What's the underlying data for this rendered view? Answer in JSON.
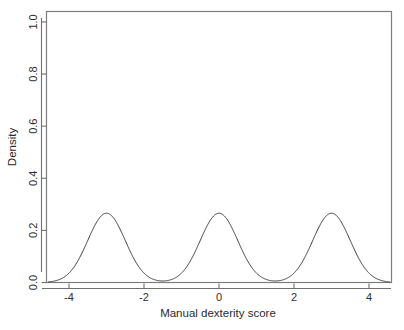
{
  "figure": {
    "background_color": "#ffffff",
    "curve_color": "#3a3a3a",
    "axis_color": "#6f6f6f",
    "box_color": "#7d7d7d"
  },
  "chart_data": {
    "type": "line",
    "title": "",
    "subtitle": "",
    "xlabel": "Manual dexterity score",
    "ylabel": "Density",
    "xlim": [
      -4.6,
      4.6
    ],
    "ylim": [
      0.0,
      1.04
    ],
    "grid": false,
    "legend": null,
    "legend_position": "none",
    "xticks": [
      -4,
      -2,
      0,
      2,
      4
    ],
    "xtick_labels": [
      "-4",
      "-2",
      "0",
      "2",
      "4"
    ],
    "yticks": [
      0.0,
      0.2,
      0.4,
      0.6,
      0.8,
      1.0
    ],
    "ytick_labels": [
      "0.0",
      "0.2",
      "0.4",
      "0.6",
      "0.8",
      "1.0"
    ],
    "mixture_components": [
      {
        "mean": -3.0,
        "sd": 0.5,
        "weight": 0.3333,
        "peak_density": 0.795
      },
      {
        "mean": 0.0,
        "sd": 0.5,
        "weight": 0.3333,
        "peak_density": 0.795
      },
      {
        "mean": 3.0,
        "sd": 0.5,
        "weight": 0.3333,
        "peak_density": 0.795
      }
    ],
    "peaks": [
      {
        "x": -3.0,
        "y": 0.795
      },
      {
        "x": 0.0,
        "y": 0.795
      },
      {
        "x": 3.0,
        "y": 0.795
      }
    ],
    "valleys": [
      {
        "x": -1.5,
        "y": 0.008
      },
      {
        "x": 1.5,
        "y": 0.008
      }
    ],
    "endpoints": [
      {
        "x": -4.55,
        "y": 0.012
      },
      {
        "x": 4.55,
        "y": 0.012
      }
    ],
    "x": [
      -4.6,
      -4.5,
      -4.4,
      -4.3,
      -4.2,
      -4.1,
      -4.0,
      -3.9,
      -3.8,
      -3.7,
      -3.6,
      -3.5,
      -3.4,
      -3.3,
      -3.2,
      -3.1,
      -3.0,
      -2.9,
      -2.8,
      -2.7,
      -2.6,
      -2.5,
      -2.4,
      -2.3,
      -2.2,
      -2.1,
      -2.0,
      -1.9,
      -1.8,
      -1.7,
      -1.6,
      -1.5,
      -1.4,
      -1.3,
      -1.2,
      -1.1,
      -1.0,
      -0.9,
      -0.8,
      -0.7,
      -0.6,
      -0.5,
      -0.4,
      -0.3,
      -0.2,
      -0.1,
      0.0,
      0.1,
      0.2,
      0.3,
      0.4,
      0.5,
      0.6,
      0.7,
      0.8,
      0.9,
      1.0,
      1.1,
      1.2,
      1.3,
      1.4,
      1.5,
      1.6,
      1.7,
      1.8,
      1.9,
      2.0,
      2.1,
      2.2,
      2.3,
      2.4,
      2.5,
      2.6,
      2.7,
      2.8,
      2.9,
      3.0,
      3.1,
      3.2,
      3.3,
      3.4,
      3.5,
      3.6,
      3.7,
      3.8,
      3.9,
      4.0,
      4.1,
      4.2,
      4.3,
      4.4,
      4.5,
      4.6
    ],
    "y": [
      0.009,
      0.015,
      0.024,
      0.037,
      0.056,
      0.082,
      0.118,
      0.164,
      0.222,
      0.292,
      0.372,
      0.458,
      0.545,
      0.627,
      0.697,
      0.752,
      0.786,
      0.798,
      0.786,
      0.752,
      0.697,
      0.627,
      0.545,
      0.458,
      0.372,
      0.292,
      0.223,
      0.165,
      0.122,
      0.09,
      0.069,
      0.058,
      0.055,
      0.062,
      0.081,
      0.113,
      0.161,
      0.224,
      0.299,
      0.383,
      0.468,
      0.549,
      0.64,
      0.688,
      0.745,
      0.782,
      0.795,
      0.782,
      0.745,
      0.688,
      0.64,
      0.549,
      0.468,
      0.383,
      0.299,
      0.224,
      0.161,
      0.113,
      0.081,
      0.062,
      0.055,
      0.058,
      0.069,
      0.09,
      0.122,
      0.165,
      0.223,
      0.292,
      0.372,
      0.458,
      0.545,
      0.627,
      0.697,
      0.752,
      0.786,
      0.798,
      0.786,
      0.752,
      0.697,
      0.627,
      0.545,
      0.458,
      0.372,
      0.292,
      0.222,
      0.164,
      0.118,
      0.082,
      0.056,
      0.037,
      0.024,
      0.015,
      0.009
    ]
  },
  "caption": {
    "text": ""
  }
}
